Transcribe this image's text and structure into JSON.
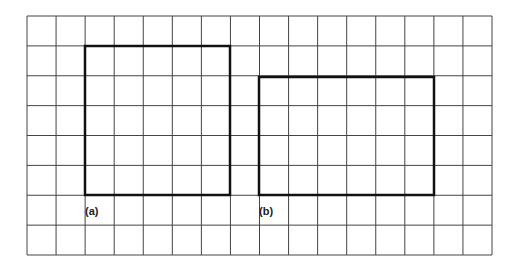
{
  "figure": {
    "grid": {
      "columns": 16,
      "rows": 8,
      "line_color": "#444444"
    },
    "shapes": [
      {
        "label": "(a)",
        "type": "rectangle",
        "grid_x": 2,
        "grid_y": 1,
        "width_cells": 5,
        "height_cells": 5
      },
      {
        "label": "(b)",
        "type": "rectangle",
        "grid_x": 8,
        "grid_y": 2,
        "width_cells": 6,
        "height_cells": 4
      }
    ]
  }
}
